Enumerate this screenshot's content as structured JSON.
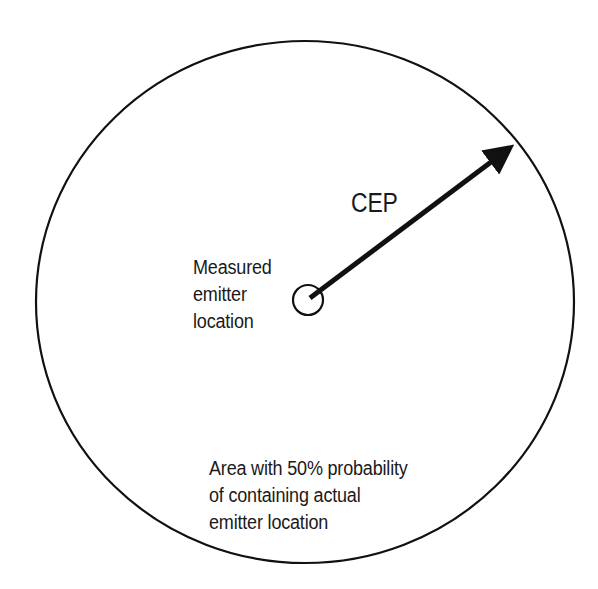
{
  "diagram": {
    "cep_label": "CEP",
    "measured_label": [
      "Measured",
      "emitter",
      "location"
    ],
    "area_label": [
      "Area with 50% probability",
      "of containing actual",
      "emitter location"
    ],
    "colors": {
      "stroke": "#111111",
      "background": "#ffffff",
      "text": "#1a1a1a"
    }
  }
}
